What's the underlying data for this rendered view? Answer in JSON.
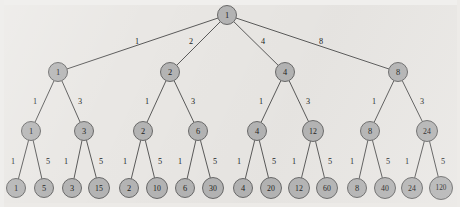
{
  "figure": {
    "kind": "recursion-tree",
    "background_color": "#e9e7e4",
    "node_fill_color": "#b4b4b4",
    "node_stroke_color": "#5d5d5d",
    "line_color": "#4a4a4a",
    "text_color": "#1c1c1c"
  },
  "levels": {
    "count": 4,
    "names": [
      "root",
      "level-1",
      "level-2",
      "leaves"
    ]
  },
  "root": {
    "label": "1",
    "x": 227,
    "y": 15,
    "r": 9.5
  },
  "level1": [
    {
      "label": "1",
      "x": 58,
      "y": 72,
      "r": 9.5,
      "edge_label": "1",
      "edge_label_x": 137,
      "edge_label_y": 41
    },
    {
      "label": "2",
      "x": 170,
      "y": 72,
      "r": 9.5,
      "edge_label": "2",
      "edge_label_x": 191,
      "edge_label_y": 41
    },
    {
      "label": "4",
      "x": 285,
      "y": 72,
      "r": 9.5,
      "edge_label": "4",
      "edge_label_x": 263,
      "edge_label_y": 41
    },
    {
      "label": "8",
      "x": 398,
      "y": 72,
      "r": 9.5,
      "edge_label": "8",
      "edge_label_x": 321,
      "edge_label_y": 41
    }
  ],
  "level2": [
    {
      "label": "1",
      "x": 31,
      "y": 131,
      "r": 9.5,
      "parent_x": 58,
      "edge_label": "1",
      "edge_label_x": 35,
      "edge_label_y": 101
    },
    {
      "label": "3",
      "x": 84,
      "y": 131,
      "r": 9.5,
      "parent_x": 58,
      "edge_label": "3",
      "edge_label_x": 80,
      "edge_label_y": 101
    },
    {
      "label": "2",
      "x": 143,
      "y": 131,
      "r": 9.5,
      "parent_x": 170,
      "edge_label": "1",
      "edge_label_x": 147,
      "edge_label_y": 101
    },
    {
      "label": "6",
      "x": 198,
      "y": 131,
      "r": 9.5,
      "parent_x": 170,
      "edge_label": "3",
      "edge_label_x": 193,
      "edge_label_y": 101
    },
    {
      "label": "4",
      "x": 257,
      "y": 131,
      "r": 9.5,
      "parent_x": 285,
      "edge_label": "1",
      "edge_label_x": 261,
      "edge_label_y": 101
    },
    {
      "label": "12",
      "x": 313,
      "y": 131,
      "r": 10.5,
      "parent_x": 285,
      "edge_label": "3",
      "edge_label_x": 308,
      "edge_label_y": 101
    },
    {
      "label": "8",
      "x": 370,
      "y": 131,
      "r": 9.5,
      "parent_x": 398,
      "edge_label": "1",
      "edge_label_x": 374,
      "edge_label_y": 101
    },
    {
      "label": "24",
      "x": 427,
      "y": 131,
      "r": 10.5,
      "parent_x": 398,
      "edge_label": "3",
      "edge_label_x": 422,
      "edge_label_y": 101
    }
  ],
  "leaves": [
    {
      "label": "1",
      "x": 16,
      "y": 188,
      "r": 9.5,
      "parent_x": 31,
      "edge_label": "1",
      "edge_label_x": 13,
      "edge_label_y": 161
    },
    {
      "label": "5",
      "x": 44,
      "y": 188,
      "r": 9.5,
      "parent_x": 31,
      "edge_label": "5",
      "edge_label_x": 48,
      "edge_label_y": 161
    },
    {
      "label": "3",
      "x": 72,
      "y": 188,
      "r": 9.5,
      "parent_x": 84,
      "edge_label": "1",
      "edge_label_x": 66,
      "edge_label_y": 161
    },
    {
      "label": "15",
      "x": 99,
      "y": 188,
      "r": 10.5,
      "parent_x": 84,
      "edge_label": "5",
      "edge_label_x": 101,
      "edge_label_y": 161
    },
    {
      "label": "2",
      "x": 129,
      "y": 188,
      "r": 9.5,
      "parent_x": 143,
      "edge_label": "1",
      "edge_label_x": 125,
      "edge_label_y": 161
    },
    {
      "label": "10",
      "x": 157,
      "y": 188,
      "r": 10.5,
      "parent_x": 143,
      "edge_label": "5",
      "edge_label_x": 160,
      "edge_label_y": 161
    },
    {
      "label": "6",
      "x": 185,
      "y": 188,
      "r": 9.5,
      "parent_x": 198,
      "edge_label": "1",
      "edge_label_x": 180,
      "edge_label_y": 161
    },
    {
      "label": "30",
      "x": 213,
      "y": 188,
      "r": 10.5,
      "parent_x": 198,
      "edge_label": "5",
      "edge_label_x": 215,
      "edge_label_y": 161
    },
    {
      "label": "4",
      "x": 243,
      "y": 188,
      "r": 9.5,
      "parent_x": 257,
      "edge_label": "1",
      "edge_label_x": 239,
      "edge_label_y": 161
    },
    {
      "label": "20",
      "x": 271,
      "y": 188,
      "r": 10.5,
      "parent_x": 257,
      "edge_label": "5",
      "edge_label_x": 274,
      "edge_label_y": 161
    },
    {
      "label": "12",
      "x": 299,
      "y": 188,
      "r": 10.5,
      "parent_x": 313,
      "edge_label": "1",
      "edge_label_x": 294,
      "edge_label_y": 161
    },
    {
      "label": "60",
      "x": 327,
      "y": 188,
      "r": 10.5,
      "parent_x": 313,
      "edge_label": "5",
      "edge_label_x": 330,
      "edge_label_y": 161
    },
    {
      "label": "8",
      "x": 357,
      "y": 188,
      "r": 9.5,
      "parent_x": 370,
      "edge_label": "1",
      "edge_label_x": 352,
      "edge_label_y": 161
    },
    {
      "label": "40",
      "x": 385,
      "y": 188,
      "r": 10.5,
      "parent_x": 370,
      "edge_label": "5",
      "edge_label_x": 388,
      "edge_label_y": 161
    },
    {
      "label": "24",
      "x": 412,
      "y": 188,
      "r": 10.5,
      "parent_x": 427,
      "edge_label": "1",
      "edge_label_x": 407,
      "edge_label_y": 161
    },
    {
      "label": "120",
      "x": 441,
      "y": 188,
      "r": 11.5,
      "parent_x": 427,
      "edge_label": "5",
      "edge_label_x": 443,
      "edge_label_y": 161
    }
  ],
  "chart_data": {
    "type": "tree",
    "title": "",
    "root_value": 1,
    "edge_weights_by_depth": [
      [
        1,
        2,
        4,
        8
      ],
      [
        1,
        3
      ],
      [
        1,
        5
      ]
    ],
    "nodes_by_depth": [
      [
        "1"
      ],
      [
        "1",
        "2",
        "4",
        "8"
      ],
      [
        "1",
        "3",
        "2",
        "6",
        "4",
        "12",
        "8",
        "24"
      ],
      [
        "1",
        "5",
        "3",
        "15",
        "2",
        "10",
        "6",
        "30",
        "4",
        "20",
        "12",
        "60",
        "8",
        "40",
        "24",
        "120"
      ]
    ],
    "leaf_values": [
      1,
      5,
      3,
      15,
      2,
      10,
      6,
      30,
      4,
      20,
      12,
      60,
      8,
      40,
      24,
      120
    ],
    "leaf_count": 16
  }
}
